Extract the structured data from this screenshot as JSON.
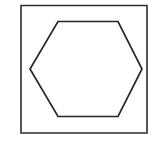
{
  "figure": {
    "canvas": {
      "width": 155,
      "height": 155,
      "background_color": "#ffffff"
    },
    "shapes": [
      {
        "name": "outer-square",
        "type": "rectangle",
        "label": "Square frame",
        "x": 21,
        "y": 5.5,
        "width": 126,
        "height": 127.5,
        "points": "21,5.5 147,5.5 147,133 21,133",
        "stroke_color": "#2e2e2e",
        "stroke_width": 1.6,
        "fill": "none"
      },
      {
        "name": "inner-hexagon",
        "type": "hexagon",
        "label": "Hexagon",
        "sides": 6,
        "orientation": "pointy-side-horizontal",
        "vertices": [
          {
            "id": "top-left",
            "x": 58,
            "y": 21.5
          },
          {
            "id": "top-right",
            "x": 118,
            "y": 21.5
          },
          {
            "id": "right",
            "x": 142,
            "y": 69
          },
          {
            "id": "bottom-right",
            "x": 118,
            "y": 116.5
          },
          {
            "id": "bottom-left",
            "x": 58,
            "y": 116.5
          },
          {
            "id": "left",
            "x": 30,
            "y": 69
          }
        ],
        "points": "58,21.5 118,21.5 142,69 118,116.5 58,116.5 30,69",
        "stroke_color": "#262626",
        "stroke_width": 1.7,
        "fill": "none"
      }
    ]
  }
}
